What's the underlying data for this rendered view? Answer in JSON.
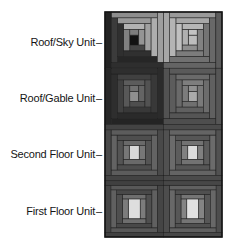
{
  "figure": {
    "background": "#ffffff",
    "text_color": "#151515",
    "outline_color": "#141414",
    "strip_stroke": "#1f1f1f"
  },
  "labels": [
    {
      "text": "Roof/Sky Unit",
      "tick": "–"
    },
    {
      "text": "Roof/Gable Unit",
      "tick": "–"
    },
    {
      "text": "Second Floor Unit",
      "tick": "–"
    },
    {
      "text": "First Floor Unit",
      "tick": "–"
    }
  ],
  "quilt": {
    "columns": 2,
    "rows": 4,
    "blocks": [
      {
        "name": "roof-sky-left",
        "order": [
          "top",
          "right",
          "bottom",
          "left"
        ],
        "center": {
          "w": 9,
          "h": 10,
          "color": "#121212"
        },
        "rounds": [
          {
            "top": "#7d7d7d",
            "right": "#949494",
            "bottom": "#454545",
            "left": "#808080"
          },
          {
            "top": "#b2b2b2",
            "right": "#a0a0a0",
            "bottom": "#303030",
            "left": "#2f2f2f"
          },
          {
            "top": "#999999",
            "right": "#adadad",
            "bottom": "#262626",
            "left": "#3b3b3b"
          },
          {
            "top": "#8d8d8d",
            "right": "#9e9e9e",
            "bottom": "#2e2e2e",
            "left": "#232323"
          }
        ]
      },
      {
        "name": "roof-sky-right",
        "order": [
          "top",
          "left",
          "bottom",
          "right"
        ],
        "center": {
          "w": 9,
          "h": 10,
          "color": "#bdbdbd"
        },
        "rounds": [
          {
            "top": "#c4c4c4",
            "left": "#b0b0b0",
            "bottom": "#8e8e8e",
            "right": "#828282"
          },
          {
            "top": "#b6b6b6",
            "left": "#c0c0c0",
            "bottom": "#7c7c7c",
            "right": "#747474"
          },
          {
            "top": "#a8a8a8",
            "left": "#b4b4b4",
            "bottom": "#707070",
            "right": "#686868"
          },
          {
            "top": "#9a9a9a",
            "left": "#a6a6a6",
            "bottom": "#646464",
            "right": "#5c5c5c"
          }
        ]
      },
      {
        "name": "roof-gable-left",
        "order": [
          "top",
          "right",
          "bottom",
          "left"
        ],
        "center": {
          "w": 9,
          "h": 10,
          "color": "#8f8f8f"
        },
        "rounds": [
          {
            "top": "#717171",
            "right": "#646464",
            "bottom": "#4e4e4e",
            "left": "#585858"
          },
          {
            "top": "#5c5c5c",
            "right": "#525252",
            "bottom": "#383838",
            "left": "#404040"
          },
          {
            "top": "#404040",
            "right": "#383838",
            "bottom": "#2a2a2a",
            "left": "#2e2e2e"
          },
          {
            "top": "#2e2e2e",
            "right": "#2b2b2b",
            "bottom": "#242424",
            "left": "#272727"
          }
        ]
      },
      {
        "name": "roof-gable-right",
        "order": [
          "top",
          "left",
          "bottom",
          "right"
        ],
        "center": {
          "w": 9,
          "h": 10,
          "color": "#ababab"
        },
        "rounds": [
          {
            "top": "#929292",
            "left": "#7c7c7c",
            "bottom": "#707070",
            "right": "#7a7a7a"
          },
          {
            "top": "#7e7e7e",
            "left": "#6a6a6a",
            "bottom": "#606060",
            "right": "#6c6c6c"
          },
          {
            "top": "#6a6a6a",
            "left": "#5c5c5c",
            "bottom": "#555555",
            "right": "#606060"
          },
          {
            "top": "#5a5a5a",
            "left": "#525252",
            "bottom": "#4e4e4e",
            "right": "#565656"
          }
        ]
      },
      {
        "name": "second-floor-left",
        "order": [
          "left",
          "right",
          "top",
          "bottom"
        ],
        "center": {
          "w": 10,
          "h": 14,
          "color": "#d8d8d8"
        },
        "rounds": [
          {
            "left": "#777777",
            "right": "#777777",
            "top": "#696969",
            "bottom": "#696969"
          },
          {
            "left": "#545454",
            "right": "#545454",
            "top": "#4e4e4e",
            "bottom": "#4e4e4e"
          },
          {
            "left": "#636363",
            "right": "#636363",
            "top": "#5c5c5c",
            "bottom": "#5c5c5c"
          },
          {
            "left": "#494949",
            "right": "#494949",
            "top": "#434343",
            "bottom": "#434343"
          }
        ]
      },
      {
        "name": "second-floor-right",
        "order": [
          "left",
          "right",
          "top",
          "bottom"
        ],
        "center": {
          "w": 10,
          "h": 14,
          "color": "#dcdcdc"
        },
        "rounds": [
          {
            "left": "#808080",
            "right": "#808080",
            "top": "#727272",
            "bottom": "#727272"
          },
          {
            "left": "#5c5c5c",
            "right": "#5c5c5c",
            "top": "#565656",
            "bottom": "#565656"
          },
          {
            "left": "#6b6b6b",
            "right": "#6b6b6b",
            "top": "#646464",
            "bottom": "#646464"
          },
          {
            "left": "#515151",
            "right": "#515151",
            "top": "#4b4b4b",
            "bottom": "#4b4b4b"
          }
        ]
      },
      {
        "name": "first-floor-left",
        "order": [
          "left",
          "right",
          "top",
          "bottom"
        ],
        "center": {
          "w": 12,
          "h": 20,
          "color": "#dedede"
        },
        "rounds": [
          {
            "left": "#7c7c7c",
            "right": "#7c7c7c",
            "top": "#6e6e6e",
            "bottom": "#6e6e6e"
          },
          {
            "left": "#4f4f4f",
            "right": "#4f4f4f",
            "top": "#484848",
            "bottom": "#484848"
          },
          {
            "left": "#606060",
            "right": "#606060",
            "top": "#585858",
            "bottom": "#585858"
          },
          {
            "left": "#454545",
            "right": "#454545",
            "top": "#404040",
            "bottom": "#404040"
          }
        ]
      },
      {
        "name": "first-floor-right",
        "order": [
          "left",
          "right",
          "top",
          "bottom"
        ],
        "center": {
          "w": 12,
          "h": 20,
          "color": "#e0e0e0"
        },
        "rounds": [
          {
            "left": "#848484",
            "right": "#848484",
            "top": "#757575",
            "bottom": "#757575"
          },
          {
            "left": "#575757",
            "right": "#575757",
            "top": "#505050",
            "bottom": "#505050"
          },
          {
            "left": "#686868",
            "right": "#686868",
            "top": "#606060",
            "bottom": "#606060"
          },
          {
            "left": "#4d4d4d",
            "right": "#4d4d4d",
            "top": "#474747",
            "bottom": "#474747"
          }
        ]
      }
    ]
  }
}
